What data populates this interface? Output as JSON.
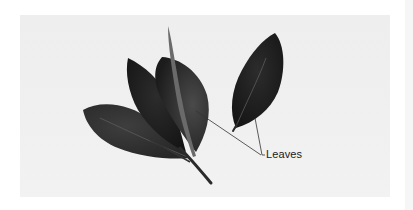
{
  "figure": {
    "background_color": "#efefef",
    "leaf_colors": [
      "#2a2a2a",
      "#1a1a1a",
      "#333333",
      "#3a3a3a"
    ],
    "annotation": {
      "label": "Leaves",
      "leader_line_count": 3
    }
  }
}
